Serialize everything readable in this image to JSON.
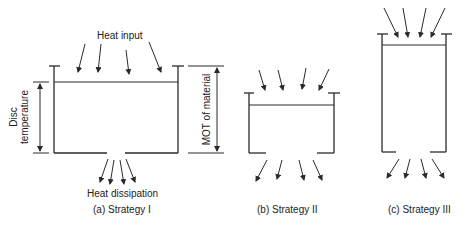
{
  "diagram": {
    "panels": [
      {
        "id": "a",
        "caption": "(a) Strategy I",
        "top_label": "Heat input",
        "bottom_label": "Heat dissipation",
        "left_dimension_label_line1": "Disc",
        "left_dimension_label_line2": "temperature",
        "right_dimension_label": "MOT of material"
      },
      {
        "id": "b",
        "caption": "(b) Strategy II"
      },
      {
        "id": "c",
        "caption": "(c) Strategy III"
      }
    ],
    "colors": {
      "line": "#2a2a2a",
      "background": "#ffffff"
    }
  }
}
